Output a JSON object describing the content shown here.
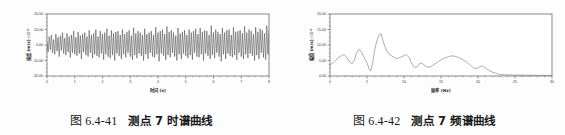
{
  "page": {
    "background_color": "#fdfdfd",
    "text_color": "#1a1a1a"
  },
  "figures": [
    {
      "id": "figure-left",
      "caption_number": "图 6.4-41",
      "caption_text": "测点 7 时谱曲线"
    },
    {
      "id": "figure-right",
      "caption_number": "图 6.4-42",
      "caption_text": "测点 7 频谱曲线"
    }
  ],
  "chart_data": [
    {
      "type": "line",
      "id": "time-history-chart",
      "title": "",
      "xlabel": "时间 (s)",
      "ylabel": "速度 (m/s)",
      "y_unit_factor": "×10",
      "y_unit_exponent": "-5",
      "xlim": [
        0,
        8
      ],
      "ylim": [
        -20,
        20
      ],
      "xticks": [
        0,
        1,
        2,
        3,
        4,
        5,
        6,
        7,
        8
      ],
      "xticklabels": [
        "0",
        "1",
        "2",
        "3",
        "4",
        "5",
        "6",
        "7",
        "8"
      ],
      "yticks": [
        -20,
        -10,
        0,
        10,
        20
      ],
      "yticklabels": [
        "-20.00",
        "-10.00",
        "0.00",
        "10.00",
        "20.00"
      ],
      "minor_xticks_per_interval": 4,
      "minor_yticks_per_interval": 4,
      "grid": false,
      "legend": null,
      "line_color": "#4a4a4a",
      "frame_color": "#555555",
      "series": [
        {
          "name": "velocity",
          "description": "dense random oscillation about zero, amplitude roughly 3 to 14 units",
          "x": [
            0.0,
            0.04,
            0.08,
            0.12,
            0.16,
            0.2,
            0.24,
            0.28,
            0.32,
            0.36,
            0.4,
            0.44,
            0.48,
            0.52,
            0.56,
            0.6,
            0.64,
            0.68,
            0.72,
            0.76,
            0.8,
            0.84,
            0.88,
            0.92,
            0.96,
            1.0,
            1.04,
            1.08,
            1.12,
            1.16,
            1.2,
            1.24,
            1.28,
            1.32,
            1.36,
            1.4,
            1.44,
            1.48,
            1.52,
            1.56,
            1.6,
            1.64,
            1.68,
            1.72,
            1.76,
            1.8,
            1.84,
            1.88,
            1.92,
            1.96,
            2.0,
            2.04,
            2.08,
            2.12,
            2.16,
            2.2,
            2.24,
            2.28,
            2.32,
            2.36,
            2.4,
            2.44,
            2.48,
            2.52,
            2.56,
            2.6,
            2.64,
            2.68,
            2.72,
            2.76,
            2.8,
            2.84,
            2.88,
            2.92,
            2.96,
            3.0,
            3.04,
            3.08,
            3.12,
            3.16,
            3.2,
            3.24,
            3.28,
            3.32,
            3.36,
            3.4,
            3.44,
            3.48,
            3.52,
            3.56,
            3.6,
            3.64,
            3.68,
            3.72,
            3.76,
            3.8,
            3.84,
            3.88,
            3.92,
            3.96,
            4.0,
            4.04,
            4.08,
            4.12,
            4.16,
            4.2,
            4.24,
            4.28,
            4.32,
            4.36,
            4.4,
            4.44,
            4.48,
            4.52,
            4.56,
            4.6,
            4.64,
            4.68,
            4.72,
            4.76,
            4.8,
            4.84,
            4.88,
            4.92,
            4.96,
            5.0,
            5.04,
            5.08,
            5.12,
            5.16,
            5.2,
            5.24,
            5.28,
            5.32,
            5.36,
            5.4,
            5.44,
            5.48,
            5.52,
            5.56,
            5.6,
            5.64,
            5.68,
            5.72,
            5.76,
            5.8,
            5.84,
            5.88,
            5.92,
            5.96,
            6.0,
            6.04,
            6.08,
            6.12,
            6.16,
            6.2,
            6.24,
            6.28,
            6.32,
            6.36,
            6.4,
            6.44,
            6.48,
            6.52,
            6.56,
            6.6,
            6.64,
            6.68,
            6.72,
            6.76,
            6.8,
            6.84,
            6.88,
            6.92,
            6.96,
            7.0,
            7.04,
            7.08,
            7.12,
            7.16,
            7.2,
            7.24,
            7.28,
            7.32,
            7.36,
            7.4,
            7.44,
            7.48,
            7.52,
            7.56,
            7.6,
            7.64,
            7.68,
            7.72,
            7.76,
            7.8,
            7.84,
            7.88,
            7.92,
            7.96,
            8.0
          ],
          "y": [
            2.0,
            -4.5,
            5.5,
            -3.0,
            6.5,
            -5.0,
            3.5,
            -6.0,
            7.0,
            -4.0,
            5.0,
            -7.5,
            6.0,
            -3.5,
            8.0,
            -5.5,
            4.5,
            -6.5,
            7.5,
            -4.5,
            5.5,
            -8.0,
            6.5,
            -5.0,
            9.0,
            -6.0,
            5.0,
            -7.0,
            8.5,
            -5.5,
            6.0,
            -9.0,
            7.0,
            -4.5,
            8.0,
            -6.5,
            5.5,
            -7.5,
            9.5,
            -5.0,
            6.5,
            -8.5,
            7.5,
            -6.0,
            10.0,
            -7.0,
            5.5,
            -8.0,
            9.0,
            -5.5,
            7.0,
            -9.5,
            8.0,
            -6.0,
            10.5,
            -7.5,
            6.0,
            -8.5,
            9.5,
            -6.5,
            7.5,
            -10.0,
            8.5,
            -5.5,
            9.0,
            -7.0,
            6.5,
            -9.0,
            10.0,
            -6.0,
            7.0,
            -8.0,
            8.5,
            -5.0,
            9.5,
            -7.5,
            6.0,
            -9.5,
            11.0,
            -6.5,
            7.5,
            -8.5,
            9.0,
            -5.5,
            8.0,
            -7.0,
            6.5,
            -10.0,
            10.5,
            -6.0,
            7.0,
            -9.0,
            8.0,
            -5.0,
            9.0,
            -7.5,
            6.5,
            -8.0,
            11.5,
            -6.0,
            8.0,
            -10.5,
            9.0,
            -5.5,
            10.0,
            -7.0,
            7.0,
            -9.5,
            12.0,
            -6.5,
            8.5,
            -8.0,
            9.5,
            -5.0,
            8.0,
            -7.5,
            6.0,
            -10.0,
            11.0,
            -6.0,
            7.5,
            -9.0,
            8.5,
            -5.5,
            9.5,
            -7.0,
            6.5,
            -8.5,
            10.0,
            -6.5,
            8.0,
            -9.5,
            9.0,
            -5.0,
            10.5,
            -7.5,
            7.0,
            -8.0,
            11.0,
            -6.0,
            8.5,
            -10.0,
            9.5,
            -5.5,
            9.0,
            -7.0,
            6.5,
            -9.0,
            12.5,
            -6.5,
            8.0,
            -8.5,
            10.0,
            -5.0,
            8.5,
            -7.5,
            7.0,
            -10.5,
            11.0,
            -6.0,
            8.0,
            -9.0,
            9.5,
            -5.5,
            10.0,
            -7.0,
            6.5,
            -8.0,
            11.5,
            -6.5,
            8.5,
            -9.5,
            9.0,
            -5.0,
            9.5,
            -7.5,
            7.5,
            -9.0,
            12.0,
            -6.0,
            8.0,
            -8.5,
            10.0,
            -5.5,
            9.0,
            -7.0,
            7.0,
            -10.0,
            11.5,
            -6.5,
            8.5,
            -9.0,
            10.5,
            -5.0,
            9.5,
            -8.0,
            7.5,
            -9.5,
            12.5,
            -6.0,
            9.0,
            -8.5,
            3.0
          ]
        }
      ]
    },
    {
      "type": "line",
      "id": "spectrum-chart",
      "title": "",
      "xlabel": "频率 (Hz)",
      "ylabel": "幅值 (m/s)",
      "y_unit_factor": "×10",
      "y_unit_exponent": "-5",
      "xlim": [
        0,
        30
      ],
      "ylim": [
        0,
        20
      ],
      "xticks": [
        0,
        5,
        10,
        15,
        20,
        25,
        30
      ],
      "xticklabels": [
        "0",
        "5",
        "10",
        "15",
        "20",
        "25",
        "30"
      ],
      "yticks": [
        0,
        5,
        10,
        15,
        20
      ],
      "yticklabels": [
        "0.00",
        "5.00",
        "10.00",
        "15.00",
        "20.00"
      ],
      "minor_xticks_per_interval": 5,
      "minor_yticks_per_interval": 4,
      "grid": false,
      "legend": null,
      "line_color": "#6b6b6b",
      "frame_color": "#555555",
      "series": [
        {
          "name": "amplitude-spectrum",
          "description": "peaks near 1.8, 3.7, 6.5 (max ~13.6), 10.3, 12.3, 16.5, 20.2 then decay to zero by 23 Hz",
          "x": [
            0.0,
            0.4,
            0.8,
            1.2,
            1.6,
            1.9,
            2.2,
            2.6,
            3.0,
            3.3,
            3.6,
            3.9,
            4.2,
            4.6,
            5.0,
            5.3,
            5.5,
            5.8,
            6.0,
            6.3,
            6.6,
            6.9,
            7.2,
            7.6,
            8.0,
            8.5,
            9.0,
            9.5,
            10.0,
            10.3,
            10.7,
            11.0,
            11.4,
            11.8,
            12.1,
            12.4,
            12.8,
            13.2,
            13.6,
            14.0,
            14.5,
            15.0,
            15.5,
            16.0,
            16.5,
            17.0,
            17.5,
            18.0,
            18.5,
            19.0,
            19.4,
            19.8,
            20.2,
            20.6,
            21.0,
            21.5,
            22.0,
            22.5,
            23.0,
            24.0,
            25.0,
            26.0,
            27.0,
            28.0,
            29.0,
            30.0
          ],
          "y": [
            3.6,
            4.2,
            5.2,
            6.0,
            6.6,
            6.9,
            6.2,
            4.6,
            4.0,
            5.2,
            7.5,
            8.6,
            8.0,
            6.0,
            4.2,
            2.2,
            1.6,
            4.5,
            8.0,
            11.0,
            13.2,
            13.6,
            11.0,
            8.4,
            7.0,
            6.2,
            5.6,
            6.0,
            6.6,
            6.9,
            6.0,
            4.2,
            2.8,
            3.0,
            4.0,
            4.2,
            3.4,
            2.8,
            3.0,
            3.6,
            4.4,
            5.2,
            5.8,
            6.2,
            6.5,
            6.3,
            5.8,
            5.2,
            4.4,
            3.4,
            2.6,
            2.4,
            3.0,
            3.2,
            2.6,
            1.8,
            1.2,
            0.8,
            0.5,
            0.35,
            0.3,
            0.28,
            0.25,
            0.22,
            0.2,
            0.18
          ]
        }
      ]
    }
  ]
}
